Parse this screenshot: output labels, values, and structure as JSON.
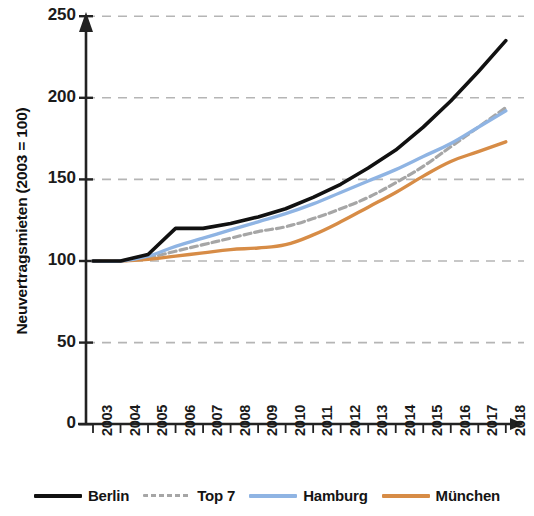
{
  "chart_data": {
    "type": "line",
    "title": "",
    "xlabel": "",
    "ylabel": "Neuvertragsmieten (2003 = 100)",
    "x": [
      2003,
      2004,
      2005,
      2006,
      2007,
      2008,
      2009,
      2010,
      2011,
      2012,
      2013,
      2014,
      2015,
      2016,
      2017,
      2018
    ],
    "xtick_labels": [
      "2003",
      "2004",
      "2005",
      "2006",
      "2007",
      "2008",
      "2009",
      "2010",
      "2011",
      "2012",
      "2013",
      "2014",
      "2015",
      "2016",
      "2017",
      "2018"
    ],
    "ytick_labels": [
      "0",
      "50",
      "100",
      "150",
      "200",
      "250"
    ],
    "ytick_values": [
      0,
      50,
      100,
      150,
      200,
      250
    ],
    "ylim": [
      0,
      250
    ],
    "grid": "horizontal-dashed",
    "legend_position": "bottom",
    "series": [
      {
        "name": "Berlin",
        "color": "#111111",
        "style": "solid",
        "width": 3.6,
        "values": [
          100,
          100,
          104,
          120,
          120,
          123,
          127,
          132,
          139,
          147,
          157,
          168,
          182,
          198,
          216,
          235
        ]
      },
      {
        "name": "Top 7",
        "color": "#a6a6a6",
        "style": "dashed",
        "width": 3.2,
        "values": [
          100,
          100,
          102,
          106,
          110,
          114,
          118,
          121,
          126,
          132,
          139,
          148,
          158,
          170,
          182,
          194
        ]
      },
      {
        "name": "Hamburg",
        "color": "#8fb4e3",
        "style": "solid",
        "width": 3.4,
        "values": [
          100,
          100,
          103,
          109,
          114,
          119,
          124,
          129,
          135,
          142,
          149,
          156,
          164,
          172,
          182,
          192
        ]
      },
      {
        "name": "München",
        "color": "#d78c46",
        "style": "solid",
        "width": 3.4,
        "values": [
          100,
          100,
          101,
          103,
          105,
          107,
          108,
          110,
          116,
          124,
          133,
          142,
          152,
          161,
          167,
          173
        ]
      }
    ]
  },
  "axis": {
    "y_title": "Neuvertragsmieten (2003 = 100)"
  },
  "legend": {
    "items": [
      {
        "label": "Berlin",
        "color": "#111111",
        "style": "solid"
      },
      {
        "label": "Top 7",
        "color": "#a6a6a6",
        "style": "dashed"
      },
      {
        "label": "Hamburg",
        "color": "#8fb4e3",
        "style": "solid"
      },
      {
        "label": "München",
        "color": "#d78c46",
        "style": "solid"
      }
    ]
  }
}
